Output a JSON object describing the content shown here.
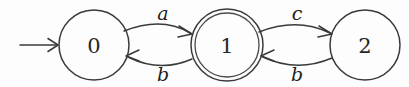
{
  "figure": {
    "name": "finite-automaton-diagram",
    "type": "state-transition-diagram",
    "background_color": "#fdfdfd",
    "stroke_color": "#3a3a3a",
    "text_color": "#262626"
  },
  "states": [
    {
      "id": "0",
      "label": "0",
      "cx": 94,
      "cy": 45,
      "r": 35,
      "accepting": false,
      "initial": true
    },
    {
      "id": "1",
      "label": "1",
      "cx": 227,
      "cy": 45,
      "r": 36,
      "inner_r": 32,
      "accepting": true,
      "initial": false
    },
    {
      "id": "2",
      "label": "2",
      "cx": 365,
      "cy": 45,
      "r": 35,
      "accepting": false,
      "initial": false
    }
  ],
  "start_arrow": {
    "label": "",
    "x1": 20,
    "y1": 45,
    "x2": 57,
    "y2": 45
  },
  "transitions": [
    {
      "id": "t0",
      "from": "0",
      "to": "1",
      "label": "a",
      "label_x": 163,
      "label_y": 20,
      "curve": "up"
    },
    {
      "id": "t1",
      "from": "1",
      "to": "0",
      "label": "b",
      "label_x": 163,
      "label_y": 79,
      "curve": "down"
    },
    {
      "id": "t2",
      "from": "1",
      "to": "2",
      "label": "c",
      "label_x": 297,
      "label_y": 20,
      "curve": "up"
    },
    {
      "id": "t3",
      "from": "2",
      "to": "1",
      "label": "b",
      "label_x": 297,
      "label_y": 79,
      "curve": "down"
    }
  ]
}
